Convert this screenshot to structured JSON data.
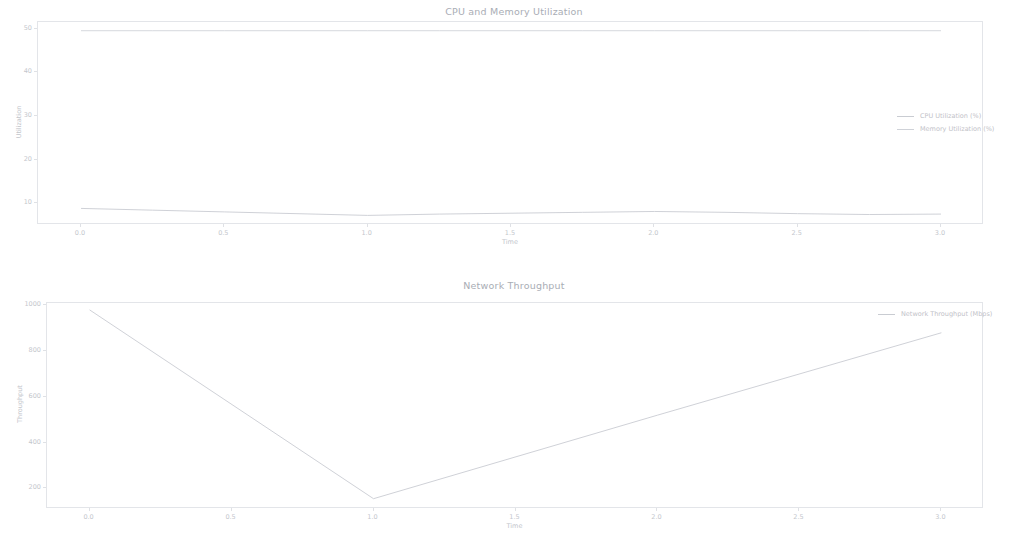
{
  "figure": {
    "background": "#ffffff",
    "line_color_cpu": "#c9ccd2",
    "line_color_memory": "#cfd2d8",
    "line_color_network": "#c9ccd2",
    "axis_color": "#e3e5e9"
  },
  "chart_data": [
    {
      "type": "line",
      "title": "CPU and Memory Utilization",
      "xlabel": "Time",
      "ylabel": "Utilization",
      "xlim": [
        -0.15,
        3.15
      ],
      "ylim": [
        5.0,
        51.5
      ],
      "xticks": [
        "0.0",
        "0.5",
        "1.0",
        "1.5",
        "2.0",
        "2.5",
        "3.0"
      ],
      "xtick_values": [
        0.0,
        0.5,
        1.0,
        1.5,
        2.0,
        2.5,
        3.0
      ],
      "yticks": [
        "10",
        "20",
        "30",
        "40",
        "50"
      ],
      "ytick_values": [
        10,
        20,
        30,
        40,
        50
      ],
      "grid": false,
      "legend_position": "center right",
      "x": [
        0.0,
        0.25,
        0.5,
        0.75,
        1.0,
        1.25,
        1.5,
        1.75,
        2.0,
        2.25,
        2.5,
        2.75,
        3.0
      ],
      "series": [
        {
          "name": "CPU Utilization (%)",
          "color": "#c9ccd2",
          "values": [
            8.8,
            8.4,
            8.0,
            7.6,
            7.2,
            7.5,
            7.7,
            7.9,
            8.1,
            7.9,
            7.6,
            7.4,
            7.5
          ]
        },
        {
          "name": "Memory Utilization (%)",
          "color": "#cfd2d8",
          "values": [
            49.5,
            49.5,
            49.5,
            49.5,
            49.5,
            49.5,
            49.5,
            49.5,
            49.5,
            49.5,
            49.5,
            49.5,
            49.5
          ]
        }
      ]
    },
    {
      "type": "line",
      "title": "Network Throughput",
      "xlabel": "Time",
      "ylabel": "Throughput",
      "xlim": [
        -0.15,
        3.15
      ],
      "ylim": [
        110,
        1010
      ],
      "xticks": [
        "0.0",
        "0.5",
        "1.0",
        "1.5",
        "2.0",
        "2.5",
        "3.0"
      ],
      "xtick_values": [
        0.0,
        0.5,
        1.0,
        1.5,
        2.0,
        2.5,
        3.0
      ],
      "yticks": [
        "200",
        "400",
        "600",
        "800",
        "1000"
      ],
      "ytick_values": [
        200,
        400,
        600,
        800,
        1000
      ],
      "grid": false,
      "legend_position": "upper right",
      "x": [
        0.0,
        1.0,
        2.0,
        3.0
      ],
      "series": [
        {
          "name": "Network Throughput (Mbps)",
          "color": "#c9ccd2",
          "values": [
            980,
            155,
            520,
            880
          ]
        }
      ]
    }
  ]
}
